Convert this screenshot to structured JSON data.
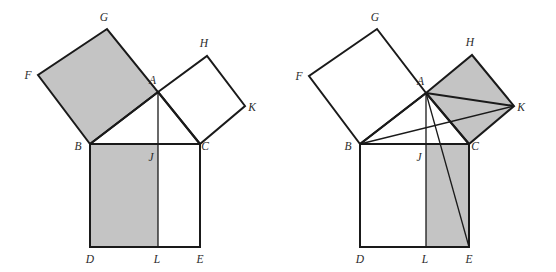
{
  "figure": {
    "background_color": "#ffffff",
    "stroke_color": "#1a1a1a",
    "shade_color": "#c4c4c4",
    "panels": [
      {
        "name": "left-panel",
        "shaded_regions": [
          "square BFGA",
          "rectangle BDLJ"
        ],
        "labels": {
          "A": "A",
          "B": "B",
          "C": "C",
          "D": "D",
          "E": "E",
          "F": "F",
          "G": "G",
          "H": "H",
          "J": "J",
          "K": "K",
          "L": "L"
        },
        "points": {
          "A": [
            158,
            92
          ],
          "B": [
            90,
            144
          ],
          "C": [
            200,
            144
          ],
          "D": [
            90,
            247
          ],
          "E": [
            200,
            247
          ],
          "F": [
            38,
            75
          ],
          "G": [
            107,
            29
          ],
          "H": [
            207,
            56
          ],
          "J": [
            158,
            144
          ],
          "K": [
            245,
            106
          ],
          "L": [
            158,
            247
          ]
        },
        "label_positions": {
          "A": [
            156,
            84
          ],
          "B": [
            78,
            150
          ],
          "C": [
            203,
            150
          ],
          "D": [
            86,
            263
          ],
          "E": [
            196,
            263
          ],
          "F": [
            27,
            77
          ],
          "G": [
            103,
            21
          ],
          "H": [
            203,
            47
          ],
          "J": [
            150,
            160
          ],
          "K": [
            250,
            111
          ],
          "L": [
            154,
            263
          ]
        }
      },
      {
        "name": "right-panel",
        "shaded_regions": [
          "square ACKH",
          "rectangle JLEC"
        ],
        "extra_lines": [
          "A to E",
          "B to K"
        ],
        "labels": {
          "A": "A",
          "B": "B",
          "C": "C",
          "D": "D",
          "E": "E",
          "F": "F",
          "G": "G",
          "H": "H",
          "J": "J",
          "K": "K",
          "L": "L"
        },
        "points": {
          "A": [
            426,
            93
          ],
          "B": [
            360,
            144
          ],
          "C": [
            469,
            144
          ],
          "D": [
            360,
            247
          ],
          "E": [
            469,
            247
          ],
          "F": [
            309,
            76
          ],
          "G": [
            377,
            29
          ],
          "H": [
            472,
            55
          ],
          "J": [
            426,
            144
          ],
          "K": [
            514,
            106
          ],
          "L": [
            426,
            247
          ]
        },
        "label_positions": {
          "A": [
            424,
            85
          ],
          "B": [
            348,
            150
          ],
          "C": [
            472,
            150
          ],
          "D": [
            356,
            263
          ],
          "E": [
            466,
            263
          ],
          "F": [
            297,
            78
          ],
          "G": [
            373,
            21
          ],
          "H": [
            469,
            46
          ],
          "J": [
            419,
            160
          ],
          "K": [
            519,
            111
          ],
          "L": [
            423,
            263
          ]
        }
      }
    ]
  }
}
